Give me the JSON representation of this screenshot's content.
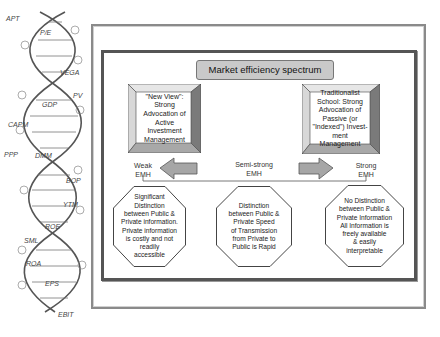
{
  "helix": {
    "labels": [
      {
        "text": "APT",
        "x": 6,
        "y": 15
      },
      {
        "text": "P/E",
        "x": 40,
        "y": 29
      },
      {
        "text": "VEGA",
        "x": 60,
        "y": 69
      },
      {
        "text": "PV",
        "x": 73,
        "y": 92
      },
      {
        "text": "GDP",
        "x": 42,
        "y": 101
      },
      {
        "text": "CAPM",
        "x": 8,
        "y": 121
      },
      {
        "text": "PPP",
        "x": 4,
        "y": 151
      },
      {
        "text": "DMM",
        "x": 35,
        "y": 152
      },
      {
        "text": "BOP",
        "x": 66,
        "y": 177
      },
      {
        "text": "YTM",
        "x": 63,
        "y": 201
      },
      {
        "text": "ROE",
        "x": 45,
        "y": 223
      },
      {
        "text": "SML",
        "x": 24,
        "y": 237
      },
      {
        "text": "ROA",
        "x": 26,
        "y": 260
      },
      {
        "text": "EPS",
        "x": 45,
        "y": 280
      },
      {
        "text": "EBIT",
        "x": 58,
        "y": 311
      }
    ]
  },
  "diagram": {
    "title": "Market efficiency spectrum",
    "left_box": [
      "\"New View\":",
      "Strong",
      "Advocation of",
      "Active Investment",
      "Management"
    ],
    "right_box": [
      "Traditionalist",
      "School: Strong",
      "Advocation of",
      "Passive (or",
      "\"Indexed\") Invest-",
      "ment Management"
    ],
    "emh_labels": {
      "weak": [
        "Weak",
        "EMH"
      ],
      "semi": [
        "Semi-strong",
        "EMH"
      ],
      "strong": [
        "Strong",
        "EMH"
      ]
    },
    "octagons": [
      [
        "Significant",
        "Distinction",
        "between Public &",
        "Private information.",
        "Private information",
        "is costly and not",
        "readily",
        "accessible"
      ],
      [
        "Distinction",
        "between Public &",
        "Private Speed",
        "of Transmission",
        "from Private to",
        "Public is Rapid"
      ],
      [
        "No Distinction",
        "between Public &",
        "Private Information",
        "All Information is",
        "freely available",
        "& easily",
        "interpretable"
      ]
    ],
    "colors": {
      "title_fill": "#c9c9c9",
      "arrow_fill": "#a6a6a6",
      "frame_dark": "#555555",
      "frame_light": "#8a8a8a"
    }
  }
}
